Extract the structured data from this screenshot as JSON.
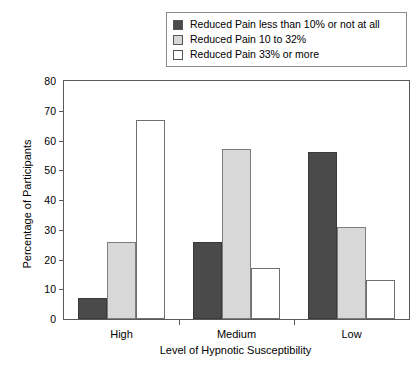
{
  "chart_data": {
    "type": "bar",
    "title": "",
    "xlabel": "Level of Hypnotic Susceptibility",
    "ylabel": "Percentage of Participants",
    "categories": [
      "High",
      "Medium",
      "Low"
    ],
    "ylim": [
      0,
      80
    ],
    "yticks": [
      0,
      10,
      20,
      30,
      40,
      50,
      60,
      70,
      80
    ],
    "ytick_labels": [
      "0",
      "10",
      "20",
      "30",
      "40",
      "50",
      "60",
      "70",
      "80"
    ],
    "grid": false,
    "legend_position": "top",
    "series": [
      {
        "name": "Reduced Pain less than 10% or not at all",
        "color": "#4a4a4a",
        "values": [
          7,
          26,
          56
        ]
      },
      {
        "name": "Reduced Pain 10 to 32%",
        "color": "#d8d8d8",
        "values": [
          26,
          57,
          31
        ]
      },
      {
        "name": "Reduced Pain 33% or more",
        "color": "#ffffff",
        "values": [
          67,
          17,
          13
        ]
      }
    ]
  },
  "legend": {
    "items": [
      {
        "label": "Reduced Pain less than 10% or not at all",
        "swatch": "#4a4a4a"
      },
      {
        "label": "Reduced Pain 10 to 32%",
        "swatch": "#d8d8d8"
      },
      {
        "label": "Reduced Pain 33% or more",
        "swatch": "#ffffff"
      }
    ]
  }
}
